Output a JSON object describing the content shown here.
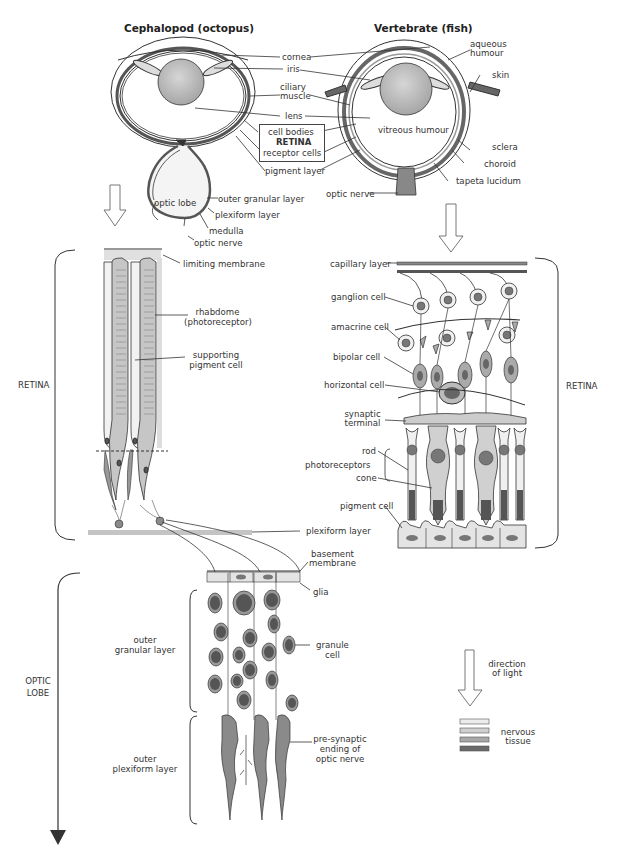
{
  "titles": {
    "left": "Cephalopod (octopus)",
    "right": "Vertebrate (fish)"
  },
  "eye_labels": {
    "cornea": "cornea",
    "iris": "iris",
    "ciliary_muscle_1": "ciliary",
    "ciliary_muscle_2": "muscle",
    "lens": "lens",
    "cell_bodies": "cell bodies",
    "retina": "RETINA",
    "receptor_cells": "receptor cells",
    "pigment_layer": "pigment layer",
    "aqueous_humour_1": "aqueous",
    "aqueous_humour_2": "humour",
    "skin": "skin",
    "vitreous_humour": "vitreous humour",
    "sclera": "sclera",
    "choroid": "choroid",
    "tapeta_lucidum": "tapeta lucidum",
    "optic_nerve_fish": "optic nerve",
    "optic_lobe": "optic lobe",
    "outer_granular_layer": "outer granular layer",
    "plexiform_layer": "plexiform layer",
    "medulla": "medulla",
    "optic_nerve_octopus": "optic nerve"
  },
  "octopus_retina": {
    "side_label": "RETINA",
    "limiting_membrane": "limiting membrane",
    "rhabdome_1": "rhabdome",
    "rhabdome_2": "(photoreceptor)",
    "supporting_1": "supporting",
    "supporting_2": "pigment cell",
    "plexiform_layer": "plexiform layer"
  },
  "fish_retina": {
    "side_label": "RETINA",
    "capillary_layer": "capillary layer",
    "ganglion_cell": "ganglion cell",
    "amacrine_cell": "amacrine cell",
    "bipolar_cell": "bipolar cell",
    "horizontal_cell": "horizontal cell",
    "synaptic_1": "synaptic",
    "synaptic_2": "terminal",
    "photoreceptors": "photoreceptors",
    "rod": "rod",
    "cone": "cone",
    "pigment_cell": "pigment cell"
  },
  "optic_lobe": {
    "side_label_1": "OPTIC",
    "side_label_2": "LOBE",
    "basement_1": "basement",
    "basement_2": "membrane",
    "glia": "glia",
    "outer_granular_1": "outer",
    "outer_granular_2": "granular layer",
    "granule_1": "granule",
    "granule_2": "cell",
    "outer_plexiform_1": "outer",
    "outer_plexiform_2": "plexiform layer",
    "presynaptic_1": "pre-synaptic",
    "presynaptic_2": "ending of",
    "presynaptic_3": "optic nerve"
  },
  "legend": {
    "direction_1": "direction",
    "direction_2": "of light",
    "nervous_1": "nervous",
    "nervous_2": "tissue",
    "swatches": [
      "#ececec",
      "#cfcfcf",
      "#a8a8a8",
      "#6a6a6a"
    ]
  },
  "colors": {
    "line": "#333333",
    "light_gray": "#e6e6e6",
    "mid_gray": "#c4c4c4",
    "dark_gray": "#8a8a8a",
    "nucleus": "#6e6e6e"
  }
}
